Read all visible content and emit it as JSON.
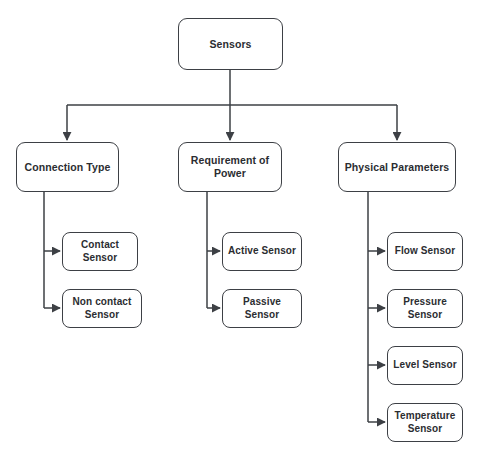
{
  "diagram": {
    "type": "hierarchy-tree",
    "style": {
      "box_fill": "#ffffff",
      "box_stroke": "#3d4045",
      "text_color": "#2b2d31",
      "edge_color": "#3d4045",
      "background": "#ffffff"
    },
    "root": {
      "id": "sensors",
      "label": "Sensors",
      "x": 178,
      "y": 18,
      "w": 105,
      "h": 52
    },
    "branches": [
      {
        "id": "connection-type",
        "label": "Connection Type",
        "x": 16,
        "y": 142,
        "w": 103,
        "h": 50,
        "children": [
          {
            "id": "contact-sensor",
            "label": "Contact\nSensor",
            "x": 62,
            "y": 232,
            "w": 76,
            "h": 39
          },
          {
            "id": "non-contact-sensor",
            "label": "Non contact\nSensor",
            "x": 62,
            "y": 289,
            "w": 80,
            "h": 39
          }
        ]
      },
      {
        "id": "requirement-of-power",
        "label": "Requirement of\nPower",
        "x": 178,
        "y": 142,
        "w": 104,
        "h": 50,
        "children": [
          {
            "id": "active-sensor",
            "label": "Active Sensor",
            "x": 222,
            "y": 232,
            "w": 80,
            "h": 39
          },
          {
            "id": "passive-sensor",
            "label": "Passive\nSensor",
            "x": 222,
            "y": 289,
            "w": 80,
            "h": 39
          }
        ]
      },
      {
        "id": "physical-parameters",
        "label": "Physical Parameters",
        "x": 338,
        "y": 142,
        "w": 118,
        "h": 50,
        "children": [
          {
            "id": "flow-sensor",
            "label": "Flow Sensor",
            "x": 387,
            "y": 232,
            "w": 76,
            "h": 39
          },
          {
            "id": "pressure-sensor",
            "label": "Pressure\nSensor",
            "x": 387,
            "y": 289,
            "w": 76,
            "h": 39
          },
          {
            "id": "level-sensor",
            "label": "Level Sensor",
            "x": 387,
            "y": 346,
            "w": 76,
            "h": 39
          },
          {
            "id": "temperature-sensor",
            "label": "Temperature\nSensor",
            "x": 387,
            "y": 403,
            "w": 76,
            "h": 39
          }
        ]
      }
    ],
    "edges": {
      "root_stem_x": 230,
      "root_stem_top": 70,
      "bus_y": 105,
      "bus_left_x": 67,
      "bus_right_x": 397,
      "drop_targets": [
        67,
        230,
        397
      ],
      "branch_stems": [
        {
          "x": 44,
          "top": 192,
          "bottom": 308
        },
        {
          "x": 207,
          "top": 192,
          "bottom": 308
        },
        {
          "x": 368,
          "top": 192,
          "bottom": 422
        }
      ],
      "elbow_rows": [
        251,
        308,
        251,
        308,
        251,
        308,
        365,
        422
      ]
    }
  }
}
